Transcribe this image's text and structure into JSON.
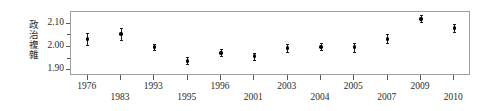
{
  "chart_data": {
    "type": "scatter",
    "title": "",
    "subtitle": "",
    "xlabel": "",
    "ylabel": "政治複雜",
    "ylabel_chars": [
      "政",
      "治",
      "複",
      "雜"
    ],
    "categories": [
      "1976",
      "1983",
      "1993",
      "1995",
      "1996",
      "2001",
      "2003",
      "2004",
      "2005",
      "2007",
      "2009",
      "2010"
    ],
    "values": [
      2.035,
      2.055,
      2.0,
      1.94,
      1.975,
      1.96,
      1.995,
      2.0,
      2.0,
      2.035,
      2.12,
      2.08
    ],
    "errors_low": [
      2.01,
      2.03,
      1.985,
      1.925,
      1.962,
      1.945,
      1.978,
      1.985,
      1.98,
      2.018,
      2.105,
      2.062
    ],
    "errors_high": [
      2.06,
      2.082,
      2.012,
      1.955,
      1.99,
      1.975,
      2.012,
      2.015,
      2.018,
      2.055,
      2.135,
      2.098
    ],
    "yticks": [
      1.9,
      2.0,
      2.1
    ],
    "ytick_labels": [
      "1.90",
      "2.00",
      "2.10"
    ],
    "ylim": [
      1.875,
      2.15
    ],
    "grid": false,
    "legend": null,
    "legend_position": "none",
    "marker_style": "filled-circle",
    "errorbar_style": "vertical-line-with-caps",
    "frame": true,
    "xlabel_stagger": [
      "hi",
      "lo",
      "hi",
      "lo",
      "hi",
      "lo",
      "hi",
      "lo",
      "hi",
      "lo",
      "hi",
      "lo"
    ]
  },
  "colors": {
    "marker": "#000000",
    "errorbar": "#1a1a1a",
    "frame": "#9aa0a4",
    "tick": "#55595c",
    "text": "#2b2b2b",
    "background": "#ffffff"
  }
}
